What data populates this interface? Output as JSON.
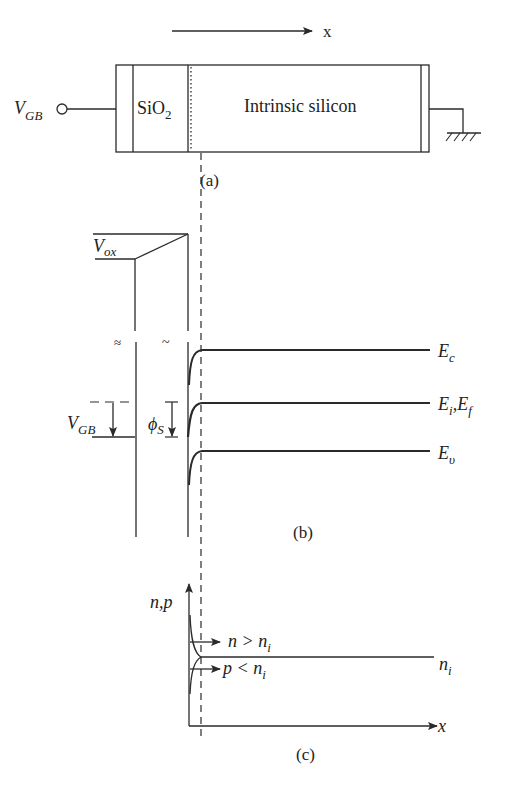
{
  "panel_a": {
    "axis_label": "x",
    "voltage_label": "V",
    "voltage_sub": "GB",
    "oxide_label": "SiO",
    "oxide_sub": "2",
    "silicon_label": "Intrinsic silicon",
    "caption": "(a)"
  },
  "panel_b": {
    "vox_label": "V",
    "vox_sub": "ox",
    "vgb_label": "V",
    "vgb_sub": "GB",
    "phis_label": "ϕ",
    "phis_sub": "S",
    "ec_label": "E",
    "ec_sub": "c",
    "ei_label": "E",
    "ei_sub": "i",
    "ef_label": ",E",
    "ef_sub": "f",
    "ev_label": "E",
    "ev_sub": "υ",
    "break_mark": "≈",
    "break_mark2": "~",
    "caption": "(b)"
  },
  "panel_c": {
    "y_label": "n,p",
    "x_label": "x",
    "n_label": "n > n",
    "n_sub": "i",
    "p_label": "p < n",
    "p_sub": "i",
    "ni_label": "n",
    "ni_sub": "i",
    "caption": "(c)"
  },
  "colors": {
    "line": "#2a2a2a",
    "background": "#ffffff"
  }
}
